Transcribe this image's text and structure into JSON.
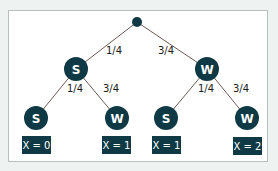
{
  "colors": {
    "background": "#eef3f2",
    "panel": "#ffffff",
    "panel_border": "#b9bfbf",
    "node_fill": "#0f3a45",
    "edge_stroke": "#6b5a55",
    "label_text": "#1a1a1a"
  },
  "tree": {
    "root": {
      "label": ""
    },
    "level1": [
      {
        "label": "S",
        "edge_prob": "1/4"
      },
      {
        "label": "W",
        "edge_prob": "3/4"
      }
    ],
    "level2": [
      {
        "label": "S",
        "edge_prob": "1/4",
        "outcome": "X = 0"
      },
      {
        "label": "W",
        "edge_prob": "3/4",
        "outcome": "X = 1"
      },
      {
        "label": "S",
        "edge_prob": "1/4",
        "outcome": "X = 1"
      },
      {
        "label": "W",
        "edge_prob": "3/4",
        "outcome": "X = 2"
      }
    ]
  }
}
